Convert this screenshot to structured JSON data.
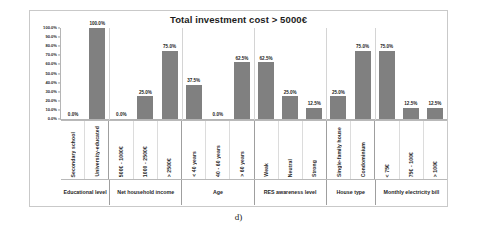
{
  "figure": {
    "caption": "d)"
  },
  "chart_data": {
    "type": "bar",
    "title": "Total investment cost > 5000€",
    "xlabel": "",
    "ylabel": "",
    "ylim": [
      0,
      100
    ],
    "grid": false,
    "legend": "none",
    "y_ticks": [
      "0.0%",
      "10.0%",
      "20.0%",
      "30.0%",
      "40.0%",
      "50.0%",
      "60.0%",
      "70.0%",
      "80.0%",
      "90.0%",
      "100.0%"
    ],
    "categories": [
      "Secondary school",
      "University-educated",
      "500€ - 1000€",
      "1000 - 2500€",
      "> 2500€",
      "< 40 years",
      "40 - 60 years",
      "> 60 years",
      "Weak",
      "Neutral",
      "Strong",
      "Single-family house",
      "Condominium",
      "< 75€",
      "75€ - 100€",
      "> 100€"
    ],
    "values": [
      0.0,
      100.0,
      0.0,
      25.0,
      75.0,
      37.5,
      0.0,
      62.5,
      62.5,
      25.0,
      12.5,
      25.0,
      75.0,
      75.0,
      12.5,
      12.5
    ],
    "data_labels": [
      "0.0%",
      "100.0%",
      "0.0%",
      "25.0%",
      "75.0%",
      "37.5%",
      "0.0%",
      "62.5%",
      "62.5%",
      "25.0%",
      "12.5%",
      "25.0%",
      "75.0%",
      "75.0%",
      "12.5%",
      "12.5%"
    ],
    "groups": [
      {
        "label": "Educational level",
        "span": 2
      },
      {
        "label": "Net household income",
        "span": 3
      },
      {
        "label": "Age",
        "span": 3
      },
      {
        "label": "RES awareness level",
        "span": 3
      },
      {
        "label": "House type",
        "span": 2
      },
      {
        "label": "Monthly electricity bill",
        "span": 3
      }
    ],
    "colors": {
      "bar": "#808080",
      "axis": "#b5b5b5",
      "frame": "#c9c9c9",
      "text": "#1f1f1f"
    }
  }
}
